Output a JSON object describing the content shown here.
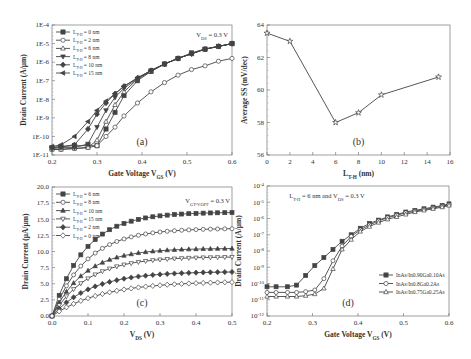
{
  "chart_data": [
    {
      "id": "a",
      "type": "line",
      "panel_label": "(a)",
      "title": "",
      "annotation": "V_DS = 0.3 V",
      "xlabel": "Gate Voltage V_GS (V)",
      "ylabel": "Drain Current (A/μm)",
      "xlim": [
        0.2,
        0.6
      ],
      "ylim_log10": [
        -11,
        -4
      ],
      "yscale": "log",
      "xticks": [
        "0.2",
        "0.3",
        "0.4",
        "0.5",
        "0.6"
      ],
      "yticks": [
        "1E-11",
        "1E-10",
        "1E-9",
        "1E-8",
        "1E-7",
        "1E-6",
        "1E-5",
        "1E-4"
      ],
      "legend_position": "upper left",
      "x": [
        0.2,
        0.22,
        0.25,
        0.28,
        0.3,
        0.32,
        0.34,
        0.36,
        0.39,
        0.42,
        0.45,
        0.48,
        0.51,
        0.54,
        0.57,
        0.6
      ],
      "series": [
        {
          "name": "L_T-H = 0 nm",
          "marker": "square-filled",
          "log10_values": [
            -10.6,
            -10.55,
            -10.5,
            -10.5,
            -10.5,
            -9.6,
            -8.7,
            -7.8,
            -7.0,
            -6.5,
            -6.1,
            -5.8,
            -5.5,
            -5.3,
            -5.15,
            -5.0
          ]
        },
        {
          "name": "L_T-H = 2 nm",
          "marker": "circle-open",
          "log10_values": [
            -10.7,
            -10.7,
            -10.65,
            -10.6,
            -10.5,
            -10.0,
            -9.5,
            -8.9,
            -8.2,
            -7.6,
            -7.1,
            -6.7,
            -6.4,
            -6.2,
            -5.95,
            -5.8
          ]
        },
        {
          "name": "L_T-H = 6 nm",
          "marker": "triangle-open",
          "log10_values": [
            -10.7,
            -10.7,
            -10.65,
            -10.6,
            -10.2,
            -9.2,
            -8.3,
            -7.6,
            -6.9,
            -6.5,
            -6.1,
            -5.8,
            -5.55,
            -5.3,
            -5.15,
            -5.0
          ]
        },
        {
          "name": "L_T-H = 8 nm",
          "marker": "triangle-down-filled",
          "log10_values": [
            -10.65,
            -10.6,
            -10.6,
            -10.4,
            -9.5,
            -8.6,
            -7.9,
            -7.4,
            -6.9,
            -6.45,
            -6.1,
            -5.8,
            -5.55,
            -5.3,
            -5.15,
            -5.0
          ]
        },
        {
          "name": "L_T-H = 10 nm",
          "marker": "diamond-filled",
          "log10_values": [
            -10.6,
            -10.55,
            -10.45,
            -9.6,
            -8.8,
            -8.2,
            -7.7,
            -7.3,
            -6.85,
            -6.45,
            -6.1,
            -5.8,
            -5.55,
            -5.3,
            -5.15,
            -5.0
          ]
        },
        {
          "name": "L_T-H = 15 nm",
          "marker": "triangle-left-filled",
          "log10_values": [
            -10.55,
            -10.45,
            -10.0,
            -9.2,
            -8.6,
            -8.1,
            -7.7,
            -7.3,
            -6.85,
            -6.45,
            -6.1,
            -5.8,
            -5.55,
            -5.3,
            -5.15,
            -5.0
          ]
        }
      ]
    },
    {
      "id": "b",
      "type": "line",
      "panel_label": "(b)",
      "title": "",
      "xlabel": "L_T-H (nm)",
      "ylabel": "Average SS (mV/dec)",
      "xlim": [
        0,
        16
      ],
      "ylim": [
        56,
        64
      ],
      "xticks": [
        "0",
        "2",
        "4",
        "6",
        "8",
        "10",
        "12",
        "14",
        "16"
      ],
      "yticks": [
        "56",
        "58",
        "60",
        "62",
        "64"
      ],
      "x": [
        0,
        2,
        6,
        8,
        10,
        15
      ],
      "series": [
        {
          "name": "Average SS",
          "marker": "star",
          "values": [
            63.5,
            63.0,
            58.0,
            58.6,
            59.7,
            60.8
          ]
        }
      ]
    },
    {
      "id": "c",
      "type": "line",
      "panel_label": "(c)",
      "title": "",
      "annotation": "V_GT-V_OFF = 0.3 V",
      "xlabel": "V_DS (V)",
      "ylabel": "Drain Current (μA/μm)",
      "xlim": [
        0,
        0.5
      ],
      "ylim": [
        0,
        20
      ],
      "xticks": [
        "0.0",
        "0.1",
        "0.2",
        "0.3",
        "0.4",
        "0.5"
      ],
      "yticks": [
        "0.0",
        "2.5",
        "5.0",
        "7.5",
        "10.0",
        "12.5",
        "15.0",
        "17.5",
        "20.0"
      ],
      "legend_position": "upper left",
      "saturation_model": "I = Isat*(1-exp(-Vds/k))",
      "series": [
        {
          "name": "L_T-H = 6 nm",
          "marker": "square-filled",
          "isat": 16.1,
          "k": 0.09
        },
        {
          "name": "L_T-H = 8 nm",
          "marker": "circle-open",
          "isat": 13.6,
          "k": 0.095
        },
        {
          "name": "L_T-H = 10 nm",
          "marker": "triangle-filled",
          "isat": 10.5,
          "k": 0.09
        },
        {
          "name": "L_T-H = 15 nm",
          "marker": "triangle-down-open",
          "isat": 9.2,
          "k": 0.1
        },
        {
          "name": "L_T-H = 2 nm",
          "marker": "diamond-filled",
          "isat": 6.9,
          "k": 0.11
        },
        {
          "name": "L_T-H = 0 nm",
          "marker": "diamond-open",
          "isat": 5.4,
          "k": 0.14
        }
      ]
    },
    {
      "id": "d",
      "type": "line",
      "panel_label": "(d)",
      "title": "",
      "annotation": "L_T-H = 6 nm and V_DS = 0.3 V",
      "xlabel": "Gate Voltage V_GS (V)",
      "ylabel": "Drain Current (A/μm)",
      "xlim": [
        0.2,
        0.6
      ],
      "ylim_log10": [
        -12,
        -4
      ],
      "yscale": "log",
      "xticks": [
        "0.2",
        "0.3",
        "0.4",
        "0.5",
        "0.6"
      ],
      "yticks": [
        "10^-12",
        "10^-11",
        "10^-10",
        "10^-9",
        "10^-8",
        "10^-7",
        "10^-6",
        "10^-5",
        "10^-4"
      ],
      "legend_position": "lower right",
      "x": [
        0.2,
        0.22,
        0.245,
        0.265,
        0.285,
        0.305,
        0.325,
        0.345,
        0.365,
        0.385,
        0.405,
        0.425,
        0.445,
        0.465,
        0.485,
        0.505,
        0.525,
        0.545,
        0.565,
        0.585,
        0.6
      ],
      "series": [
        {
          "name": "InAs/In0.90Ga0.10As",
          "marker": "square-filled",
          "log10_values": [
            -10.2,
            -10.2,
            -10.2,
            -10.1,
            -9.5,
            -8.9,
            -8.4,
            -7.9,
            -7.4,
            -7.0,
            -6.6,
            -6.3,
            -6.1,
            -5.9,
            -5.75,
            -5.6,
            -5.5,
            -5.4,
            -5.3,
            -5.2,
            -5.1
          ]
        },
        {
          "name": "InAs/In0.8Ga0.2As",
          "marker": "circle-open",
          "log10_values": [
            -10.55,
            -10.55,
            -10.55,
            -10.55,
            -10.5,
            -10.4,
            -9.7,
            -8.6,
            -7.7,
            -7.1,
            -6.7,
            -6.4,
            -6.15,
            -5.95,
            -5.8,
            -5.65,
            -5.55,
            -5.45,
            -5.35,
            -5.25,
            -5.15
          ]
        },
        {
          "name": "InAs/In0.75Ga0.25As",
          "marker": "triangle-open",
          "log10_values": [
            -10.8,
            -10.8,
            -10.8,
            -10.8,
            -10.75,
            -10.65,
            -10.3,
            -9.1,
            -7.9,
            -7.3,
            -6.8,
            -6.5,
            -6.25,
            -6.05,
            -5.9,
            -5.75,
            -5.6,
            -5.5,
            -5.4,
            -5.3,
            -5.2
          ]
        }
      ]
    }
  ]
}
